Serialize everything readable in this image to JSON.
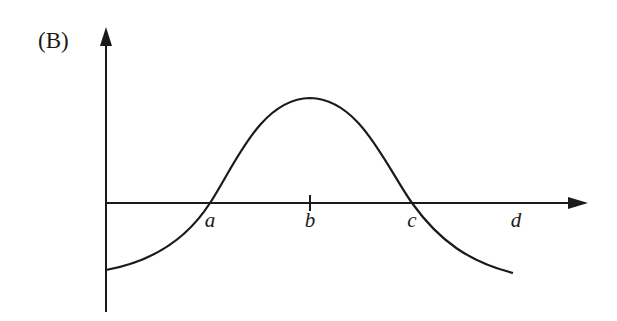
{
  "figure": {
    "panel_label": "(B)",
    "x_axis_labels": [
      {
        "text": "a",
        "x": 210
      },
      {
        "text": "b",
        "x": 310
      },
      {
        "text": "c",
        "x": 412
      },
      {
        "text": "d",
        "x": 516
      }
    ],
    "curve_description": "Bell-shaped curve starting below the x-axis, crossing at a, peaking above b, crossing at c, and ending below the axis",
    "line_color": "#1a1a1a"
  }
}
